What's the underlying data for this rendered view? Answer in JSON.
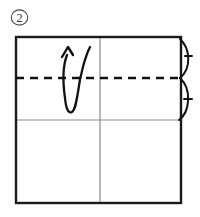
{
  "figure": {
    "step_label": "2",
    "step_label_style": "circled",
    "background_color": "#ffffff"
  },
  "colors": {
    "paper_outline": "#1a1a1a",
    "fold_line": "#111111",
    "crease_line": "#8a8a8a",
    "arrow": "#111111",
    "step_number": "#3b3b3b"
  },
  "paper": {
    "name": "square-sheet",
    "left": 16,
    "top": 37,
    "right": 181,
    "bottom": 203,
    "stroke_width": 2.4
  },
  "lines": {
    "fold_dashed": {
      "name": "horizontal-fold-line",
      "y": 78,
      "x1": 16,
      "x2": 181,
      "style": "dashed",
      "dash": "8 6",
      "stroke_width": 2.2
    },
    "crease_horizontal": {
      "name": "horizontal-crease-line",
      "y": 120,
      "x1": 16,
      "x2": 181,
      "style": "solid",
      "stroke_width": 1.1
    },
    "crease_vertical": {
      "name": "vertical-center-crease-line",
      "x": 100,
      "y1": 37,
      "y2": 203,
      "style": "solid",
      "stroke_width": 1.1
    }
  },
  "arrows": {
    "fold_arrow": {
      "name": "fold-up-arrow",
      "direction": "up",
      "shape": "u-turn",
      "description": "curved valley fold arrow turning upward"
    },
    "edge_arc_upper": {
      "name": "upper-edge-fold-arc",
      "direction": "outward-up",
      "description": "arc bulging right from top-right corner to fold line"
    },
    "edge_arc_lower": {
      "name": "lower-edge-fold-arc",
      "direction": "outward-down",
      "description": "arc bulging right from fold line down to crease line"
    }
  }
}
